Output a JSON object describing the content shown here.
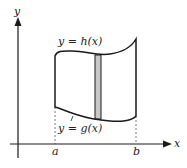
{
  "figure": {
    "axes": {
      "x_label": "x",
      "y_label": "y"
    },
    "curves": {
      "upper": "y = h(x)",
      "lower": "y = g(x)"
    },
    "bounds": {
      "left": "a",
      "right": "b"
    },
    "colors": {
      "stroke": "#1a1a1a",
      "strip_fill": "#c8c8c8",
      "dashed": "#555555"
    }
  }
}
